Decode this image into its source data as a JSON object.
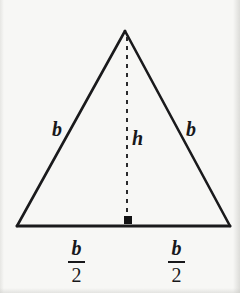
{
  "figure": {
    "type": "geometry-diagram",
    "shape": "isosceles-triangle",
    "background_color": "#f7f7f5",
    "stroke_color": "#1a1a1c",
    "width": 240,
    "height": 293
  },
  "geometry": {
    "apex": {
      "x": 125,
      "y": 31
    },
    "base_left": {
      "x": 17,
      "y": 226
    },
    "base_right": {
      "x": 230,
      "y": 226
    },
    "altitude_foot": {
      "x": 127,
      "y": 226
    },
    "stroke_width": 2.6,
    "altitude_dash_pattern": "4 5",
    "altitude_stroke_width": 2,
    "right_angle_marker": {
      "x": 124,
      "y": 216,
      "size": 8
    }
  },
  "labels": {
    "left_side": "b",
    "right_side": "b",
    "height": "h",
    "left_base_numerator": "b",
    "left_base_denominator": "2",
    "right_base_numerator": "b",
    "right_base_denominator": "2"
  }
}
